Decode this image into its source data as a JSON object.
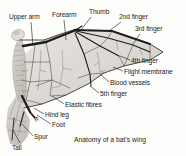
{
  "figure": {
    "caption": "Anatomy of a bat's wing",
    "background_color": "#fdfdfc",
    "ink_color": "#1b1b1b",
    "membrane_fill": "#dedad6",
    "membrane_fill_light": "#ebe8e5",
    "body_fill": "#cfcac5"
  },
  "labels": [
    {
      "id": "upper-arm",
      "text": "Upper arm",
      "x": 9,
      "y": 13
    },
    {
      "id": "forearm",
      "text": "Forearm",
      "x": 52,
      "y": 11
    },
    {
      "id": "thumb",
      "text": "Thumb",
      "x": 89,
      "y": 8
    },
    {
      "id": "second-finger",
      "text": "2nd finger",
      "x": 119,
      "y": 13
    },
    {
      "id": "third-finger",
      "text": "3rd finger",
      "x": 135,
      "y": 25
    },
    {
      "id": "fourth-finger",
      "text": "4th finger",
      "x": 131,
      "y": 57
    },
    {
      "id": "flight-membrane",
      "text": "Flight membrane",
      "x": 124,
      "y": 68
    },
    {
      "id": "blood-vessels",
      "text": "Blood vessels",
      "x": 110,
      "y": 79
    },
    {
      "id": "fifth-finger",
      "text": "5th finger",
      "x": 100,
      "y": 90
    },
    {
      "id": "elastic-fibres",
      "text": "Elastic fibres",
      "x": 65,
      "y": 101
    },
    {
      "id": "hind-leg",
      "text": "Hind leg",
      "x": 45,
      "y": 111
    },
    {
      "id": "foot",
      "text": "Foot",
      "x": 52,
      "y": 121
    },
    {
      "id": "spur",
      "text": "Spur",
      "x": 34,
      "y": 133
    },
    {
      "id": "tail",
      "text": "Tail",
      "x": 12,
      "y": 144
    }
  ],
  "caption_pos": {
    "x": 74,
    "y": 136
  },
  "leaders": [
    {
      "id": "leader-upper-arm",
      "d": "M31,22 L33,46"
    },
    {
      "id": "leader-forearm",
      "d": "M64,20 L66,40"
    },
    {
      "id": "leader-thumb",
      "d": "M91,17 L81,30"
    },
    {
      "id": "leader-second-finger",
      "d": "M121,22 L109,31"
    },
    {
      "id": "leader-third-finger",
      "d": "M140,34 L133,44"
    },
    {
      "id": "leader-fourth-finger",
      "d": "M130,60 L120,56"
    },
    {
      "id": "leader-flight-membrane",
      "d": "M123,71 L113,67"
    },
    {
      "id": "leader-blood-vessels",
      "d": "M109,82 L100,74"
    },
    {
      "id": "leader-fifth-finger",
      "d": "M99,93 L90,86"
    },
    {
      "id": "leader-elastic-fibres",
      "d": "M64,104 L52,96"
    },
    {
      "id": "leader-hind-leg",
      "d": "M44,114 L34,108"
    },
    {
      "id": "leader-foot",
      "d": "M51,124 L37,115"
    },
    {
      "id": "leader-spur",
      "d": "M33,136 L22,124"
    },
    {
      "id": "leader-tail",
      "d": "M20,143 L13,130"
    }
  ]
}
